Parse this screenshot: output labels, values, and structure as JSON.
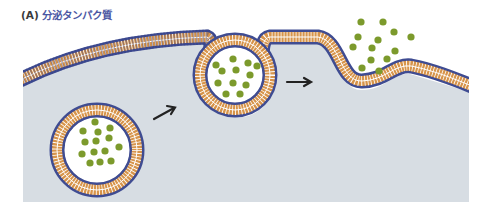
{
  "figure": {
    "panel_label": "(A)",
    "title": "分泌タンパク質",
    "colors": {
      "cytoplasm": "#d7dde3",
      "membrane_head": "#3f4c92",
      "membrane_tail": "#d7944a",
      "membrane_stripe": "#ffffff",
      "protein": "#7c9a2c",
      "vesicle_lumen": "#ffffff",
      "arrow": "#222222",
      "title_label": "#3a3a3a",
      "title_text": "#4b57a3"
    },
    "elements": [
      {
        "name": "plasma-membrane",
        "description": "lipid bilayer bounding the cell"
      },
      {
        "name": "secretory-vesicle",
        "description": "vesicle containing proteins inside cytoplasm"
      },
      {
        "name": "fusing-vesicle",
        "description": "vesicle fusing with plasma membrane"
      },
      {
        "name": "released-proteins",
        "description": "proteins released outside the cell"
      },
      {
        "name": "arrow-1",
        "description": "step arrow"
      },
      {
        "name": "arrow-2",
        "description": "step arrow"
      }
    ]
  }
}
